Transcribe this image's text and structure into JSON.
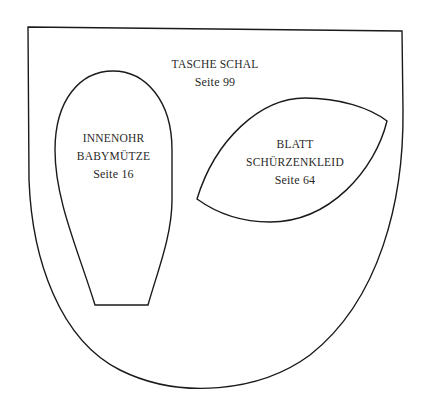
{
  "diagram": {
    "type": "sewing-pattern-template",
    "stroke_color": "#1a1a1a",
    "text_color": "#2a2a2a",
    "background": "#ffffff"
  },
  "pieces": [
    {
      "id": "tasche",
      "title": "TASCHE SCHAL",
      "page": "Seite 99"
    },
    {
      "id": "innenohr",
      "title_line1": "INNENOHR",
      "title_line2": "BABYMÜTZE",
      "page": "Seite 16"
    },
    {
      "id": "blatt",
      "title_line1": "BLATT",
      "title_line2": "SCHÜRZENKLEID",
      "page": "Seite 64"
    }
  ]
}
